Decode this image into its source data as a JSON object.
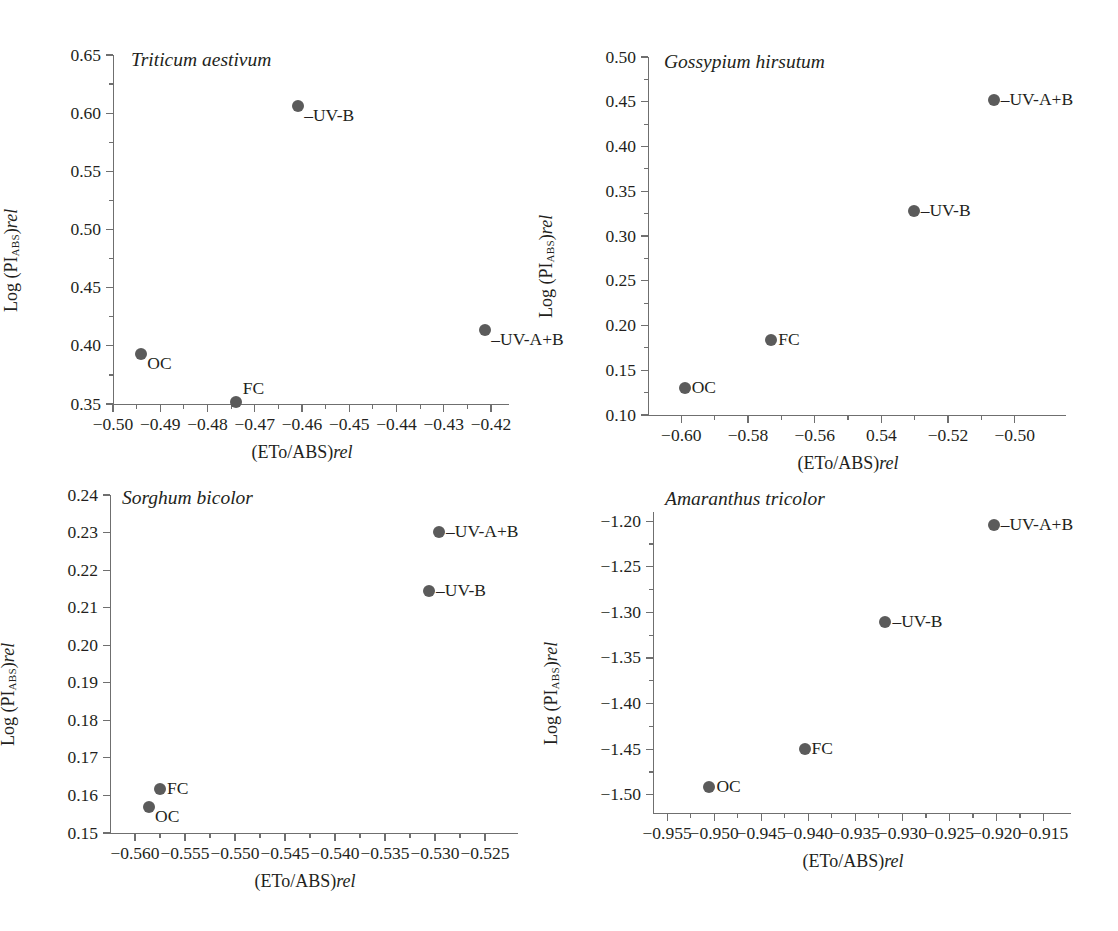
{
  "figure": {
    "marker_color": "#5b5b5b",
    "axis_color": "#6f6f6f",
    "text_color": "#231f20",
    "x_axis_title_html": "(ETo/ABS)rel",
    "y_axis_title_html": "Log (PIABS)rel"
  },
  "chart_data": [
    {
      "type": "scatter",
      "title": "Triticum aestivum",
      "xlabel": "(ETo/ABS)rel",
      "ylabel": "Log (PI_ABS)rel",
      "xlim": [
        -0.5,
        -0.42
      ],
      "ylim": [
        0.35,
        0.65
      ],
      "xticks": [
        -0.5,
        -0.49,
        -0.48,
        -0.47,
        -0.46,
        -0.45,
        -0.44,
        -0.43,
        -0.42
      ],
      "xticklabels": [
        "−0.50",
        "−0.49",
        "−0.48",
        "−0.47",
        "−0.46",
        "−0.45",
        "−0.44",
        "−0.43",
        "−0.42"
      ],
      "yticks": [
        0.35,
        0.4,
        0.45,
        0.5,
        0.55,
        0.6,
        0.65
      ],
      "yticklabels": [
        "0.35",
        "0.40",
        "0.45",
        "0.50",
        "0.55",
        "0.60",
        "0.65"
      ],
      "minor_y_between": 1,
      "minor_x_between": 1,
      "grid": false,
      "points": [
        {
          "label": "OC",
          "x": -0.494,
          "y": 0.393,
          "label_pos": "below-right"
        },
        {
          "label": "FC",
          "x": -0.474,
          "y": 0.352,
          "label_pos": "above-right"
        },
        {
          "label": "–UV-B",
          "x": -0.4608,
          "y": 0.606,
          "label_pos": "below-right"
        },
        {
          "label": "–UV-A+B",
          "x": -0.4212,
          "y": 0.414,
          "label_pos": "below-right"
        }
      ]
    },
    {
      "type": "scatter",
      "title": "Gossypium hirsutum",
      "xlabel": "(ETo/ABS)rel",
      "ylabel": "Log (PI_ABS)rel",
      "xlim": [
        -0.61,
        -0.49
      ],
      "ylim": [
        0.1,
        0.5
      ],
      "xticks": [
        -0.6,
        -0.58,
        -0.56,
        -0.54,
        -0.52,
        -0.5
      ],
      "xticklabels": [
        "−0.60",
        "−0.58",
        "−0.56",
        "0.54",
        "−0.52",
        "−0.50"
      ],
      "yticks": [
        0.1,
        0.15,
        0.2,
        0.25,
        0.3,
        0.35,
        0.4,
        0.45,
        0.5
      ],
      "yticklabels": [
        "0.10",
        "0.15",
        "0.20",
        "0.25",
        "0.30",
        "0.35",
        "0.40",
        "0.45",
        "0.50"
      ],
      "minor_y_between": 1,
      "minor_x_between": 1,
      "grid": false,
      "points": [
        {
          "label": "OC",
          "x": -0.599,
          "y": 0.13,
          "label_pos": "right"
        },
        {
          "label": "FC",
          "x": -0.573,
          "y": 0.184,
          "label_pos": "right"
        },
        {
          "label": "–UV-B",
          "x": -0.5303,
          "y": 0.328,
          "label_pos": "right"
        },
        {
          "label": "–UV-A+B",
          "x": -0.5063,
          "y": 0.452,
          "label_pos": "right"
        }
      ]
    },
    {
      "type": "scatter",
      "title": "Sorghum bicolor",
      "xlabel": "(ETo/ABS)rel",
      "ylabel": "Log (PI_ABS)rel",
      "xlim": [
        -0.5625,
        -0.5235
      ],
      "ylim": [
        0.15,
        0.24
      ],
      "xticks": [
        -0.56,
        -0.555,
        -0.55,
        -0.545,
        -0.54,
        -0.535,
        -0.53,
        -0.525
      ],
      "xticklabels": [
        "−0.560",
        "−0.555",
        "−0.550",
        "−0.545",
        "−0.540",
        "−0.535",
        "−0.530",
        "−0.525"
      ],
      "yticks": [
        0.15,
        0.16,
        0.17,
        0.18,
        0.19,
        0.2,
        0.21,
        0.22,
        0.23,
        0.24
      ],
      "yticklabels": [
        "0.15",
        "0.16",
        "0.17",
        "0.18",
        "0.19",
        "0.20",
        "0.21",
        "0.22",
        "0.23",
        "0.24"
      ],
      "minor_y_between": 0,
      "minor_x_between": 1,
      "grid": false,
      "points": [
        {
          "label": "OC",
          "x": -0.5586,
          "y": 0.1568,
          "label_pos": "below-right"
        },
        {
          "label": "FC",
          "x": -0.5575,
          "y": 0.1617,
          "label_pos": "right"
        },
        {
          "label": "–UV-B",
          "x": -0.5306,
          "y": 0.2145,
          "label_pos": "right"
        },
        {
          "label": "–UV-A+B",
          "x": -0.5296,
          "y": 0.2302,
          "label_pos": "right"
        }
      ]
    },
    {
      "type": "scatter",
      "title": "Amaranthus tricolor",
      "xlabel": "(ETo/ABS)rel",
      "ylabel": "Log (PI_ABS)rel",
      "xlim": [
        -0.9565,
        -0.914
      ],
      "ylim": [
        -1.52,
        -1.19
      ],
      "xticks": [
        -0.955,
        -0.95,
        -0.945,
        -0.94,
        -0.935,
        -0.93,
        -0.925,
        -0.92,
        -0.915
      ],
      "xticklabels": [
        "−0.955",
        "−0.950",
        "−0.945",
        "−0.940",
        "−0.935",
        "−0.930",
        "−0.925",
        "−0.920",
        "−0.915"
      ],
      "yticks": [
        -1.5,
        -1.45,
        -1.4,
        -1.35,
        -1.3,
        -1.25,
        -1.2
      ],
      "yticklabels": [
        "−1.50",
        "−1.45",
        "−1.40",
        "−1.35",
        "−1.30",
        "−1.25",
        "−1.20"
      ],
      "minor_y_between": 1,
      "minor_x_between": 1,
      "grid": false,
      "points": [
        {
          "label": "OC",
          "x": -0.9505,
          "y": -1.492,
          "label_pos": "right"
        },
        {
          "label": "FC",
          "x": -0.9404,
          "y": -1.45,
          "label_pos": "right"
        },
        {
          "label": "–UV-B",
          "x": -0.9318,
          "y": -1.311,
          "label_pos": "right"
        },
        {
          "label": "–UV-A+B",
          "x": -0.9203,
          "y": -1.204,
          "label_pos": "right"
        }
      ]
    }
  ]
}
